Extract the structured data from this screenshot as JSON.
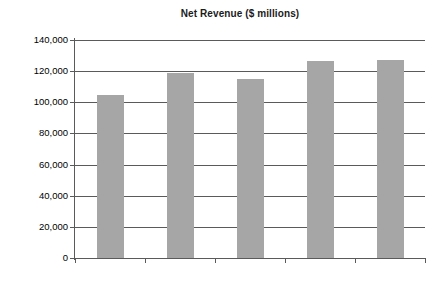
{
  "chart_data": {
    "type": "bar",
    "title": "Net Revenue ($ millions)",
    "xlabel": "",
    "ylabel": "",
    "categories": [
      "2007",
      "2008",
      "2009",
      "2010",
      "2011"
    ],
    "values": [
      104700,
      118800,
      115000,
      126500,
      127200
    ],
    "ylim": [
      0,
      140000
    ],
    "yticks": [
      0,
      20000,
      40000,
      60000,
      80000,
      100000,
      120000,
      140000
    ],
    "ytick_labels": [
      "0",
      "20,000",
      "40,000",
      "60,000",
      "80,000",
      "100,000",
      "120,000",
      "140,000"
    ],
    "grid": true,
    "legend": false,
    "bar_color": "#a6a6a6",
    "axis_color": "#5a5a5a",
    "background_color": "#ffffff"
  }
}
